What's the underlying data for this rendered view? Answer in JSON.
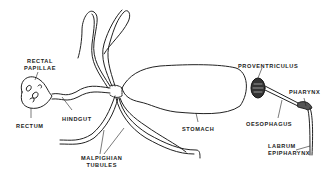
{
  "diagram": {
    "labels": {
      "rectal_papillae_line1": "RECTAL",
      "rectal_papillae_line2": "PAPILLAE",
      "rectum": "RECTUM",
      "hindgut": "HINDGUT",
      "malpighian_line1": "MALPIGHIAN",
      "malpighian_line2": "TUBULES",
      "stomach": "STOMACH",
      "proventriculus": "PROVENTRICULUS",
      "oesophagus": "OESOPHAGUS",
      "pharynx": "PHARYNX",
      "labrum_line1": "LABRUM",
      "labrum_line2": "EPIPHARYNX"
    },
    "colors": {
      "ink": "#222222",
      "background": "#ffffff"
    }
  }
}
